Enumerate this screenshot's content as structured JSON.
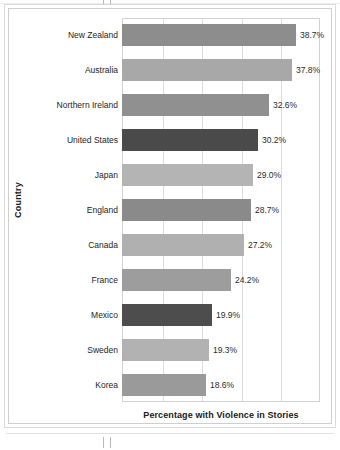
{
  "chart_data": {
    "type": "bar",
    "orientation": "horizontal",
    "title": "",
    "xlabel": "Percentage with Violence in Stories",
    "ylabel": "Country",
    "categories": [
      "New Zealand",
      "Australia",
      "Northern Ireland",
      "United States",
      "Japan",
      "England",
      "Canada",
      "France",
      "Mexico",
      "Sweden",
      "Korea"
    ],
    "values": [
      38.7,
      37.8,
      32.6,
      30.2,
      29.0,
      28.7,
      27.2,
      24.2,
      19.9,
      19.3,
      18.6
    ],
    "value_labels": [
      "38.7%",
      "37.8%",
      "32.6%",
      "30.2%",
      "29.0%",
      "28.7%",
      "27.2%",
      "24.2%",
      "19.9%",
      "19.3%",
      "18.6%"
    ],
    "bar_colors": [
      "#8d8d8d",
      "#a8a8a8",
      "#909090",
      "#4a4a4a",
      "#b4b4b4",
      "#8a8a8a",
      "#b0b0b0",
      "#9d9d9d",
      "#4d4d4d",
      "#b2b2b2",
      "#9a9a9a"
    ],
    "xlim": [
      0,
      44
    ],
    "grid": true,
    "gridline_values": [
      8.8,
      17.6,
      26.4,
      35.2
    ],
    "legend": "none",
    "axis_frame_color": "#d2d2d2",
    "gridline_color": "#dcdcdc",
    "text_color": "#1a1a1a"
  }
}
